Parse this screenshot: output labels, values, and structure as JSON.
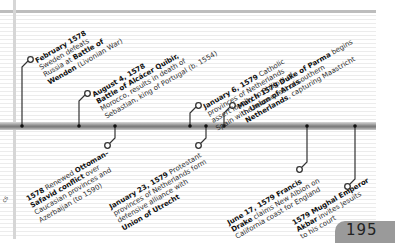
{
  "page_number": "195",
  "edge_fragment": "cs",
  "events_above": [
    {
      "id": "feb1578",
      "bold": "February 1578",
      "lines": [
        "Sweden defeats",
        "Russia at ",
        "Wenden (Livonian War)"
      ],
      "html": "<b>February 1578</b><br>Sweden defeats<br>Russia at <b>Battle of</b><br><b>Wenden</b> (Livonian War)"
    },
    {
      "id": "aug1578",
      "html": "<b>August 4, 1578</b><br><b>Battle of Alcácer Quibir,</b><br>Morocco, results in death of<br>Sebastian, king of Portugal (b. 1554)"
    },
    {
      "id": "jan6_1579",
      "html": "<b>January 6, 1579</b> Catholic<br>provinces of Netherlands<br>assert loyalty to Philip II of<br>Spain with <b>Union of Arras</b>"
    },
    {
      "id": "mar1579",
      "html": "<b>March 1579 Duke of Parma</b> begins<br>the reconquest of southern<br><b>Netherlands</b>, capturing Maastricht"
    }
  ],
  "events_below": [
    {
      "id": "ott1578",
      "html": "<b>1578</b> Renewed <b>Ottoman–</b><br><b>Safavid conflict</b> over<br>Caucasian provinces and<br>Azerbaijan (to 1590)"
    },
    {
      "id": "jan23_1579",
      "html": "<b>January 23, 1579</b> Protestant<br>provinces of Netherlands form<br>defensive alliance with<br><b>Union of Utrecht</b>"
    },
    {
      "id": "jun1579",
      "html": "<b>June 17, 1579 Francis</b><br><b>Drake</b> claims New Albion on<br>California coast for England"
    },
    {
      "id": "akbar1579",
      "html": "<b>1579 Mughal Emperor</b><br><b>Akbar</b> invites Jesuits<br>to his court"
    }
  ]
}
